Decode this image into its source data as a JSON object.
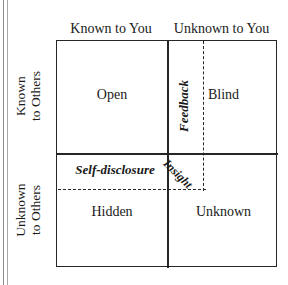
{
  "diagram": {
    "type": "2x2-matrix",
    "columns": [
      {
        "id": "known-to-you",
        "label": "Known to You"
      },
      {
        "id": "unknown-to-you",
        "label": "Unknown to You"
      }
    ],
    "rows": [
      {
        "id": "known-to-others",
        "line1": "Known",
        "line2": "to Others"
      },
      {
        "id": "unknown-to-others",
        "line1": "Unknown",
        "line2": "to Others"
      }
    ],
    "quadrants": [
      {
        "id": "open",
        "label": "Open",
        "row": "known-to-others",
        "column": "known-to-you"
      },
      {
        "id": "blind",
        "label": "Blind",
        "row": "known-to-others",
        "column": "unknown-to-you"
      },
      {
        "id": "hidden",
        "label": "Hidden",
        "row": "unknown-to-others",
        "column": "known-to-you"
      },
      {
        "id": "unknown",
        "label": "Unknown",
        "row": "unknown-to-others",
        "column": "unknown-to-you"
      }
    ],
    "processes": [
      {
        "id": "feedback",
        "label": "Feedback",
        "orientation": "vertical",
        "style": "italic"
      },
      {
        "id": "self-disclosure",
        "label": "Self-disclosure",
        "orientation": "horizontal",
        "style": "italic"
      },
      {
        "id": "insight",
        "label": "Insight",
        "orientation": "diagonal",
        "style": "italic"
      }
    ],
    "colors": {
      "line": "#262626",
      "text": "#1a1a1a",
      "background": "#ffffff"
    }
  }
}
